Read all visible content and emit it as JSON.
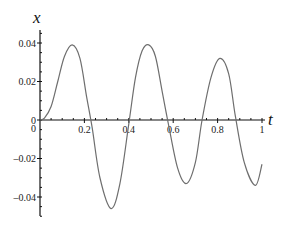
{
  "chart_data": {
    "type": "line",
    "title": "",
    "xlabel": "t",
    "ylabel": "x",
    "xlim": [
      0,
      1
    ],
    "ylim": [
      -0.05,
      0.045
    ],
    "grid": false,
    "legend": null,
    "x_ticks": [
      {
        "value": 0.2,
        "label": "0.2"
      },
      {
        "value": 0.4,
        "label": "0.4"
      },
      {
        "value": 0.6,
        "label": "0.6"
      },
      {
        "value": 0.8,
        "label": "0.8"
      },
      {
        "value": 1,
        "label": "1"
      }
    ],
    "y_ticks": [
      {
        "value": 0.04,
        "label": "0.04"
      },
      {
        "value": 0.02,
        "label": "0.02"
      },
      {
        "value": 0,
        "label": "0"
      },
      {
        "value": -0.02,
        "label": "–0.02"
      },
      {
        "value": -0.04,
        "label": "–0.04"
      }
    ],
    "series": [
      {
        "name": "x(t)",
        "color": "#6e6e6e",
        "x": [
          0,
          0.02,
          0.05,
          0.08,
          0.11,
          0.145,
          0.18,
          0.21,
          0.235,
          0.27,
          0.32,
          0.36,
          0.4,
          0.43,
          0.46,
          0.49,
          0.52,
          0.55,
          0.58,
          0.62,
          0.66,
          0.7,
          0.73,
          0.77,
          0.81,
          0.85,
          0.88,
          0.92,
          0.97,
          1.0
        ],
        "y": [
          0,
          0.001,
          0.007,
          0.02,
          0.033,
          0.039,
          0.032,
          0.012,
          -0.004,
          -0.03,
          -0.046,
          -0.033,
          -0.002,
          0.022,
          0.036,
          0.039,
          0.033,
          0.015,
          -0.003,
          -0.025,
          -0.033,
          -0.022,
          0.0,
          0.022,
          0.032,
          0.024,
          0.002,
          -0.022,
          -0.034,
          -0.023
        ]
      }
    ]
  }
}
